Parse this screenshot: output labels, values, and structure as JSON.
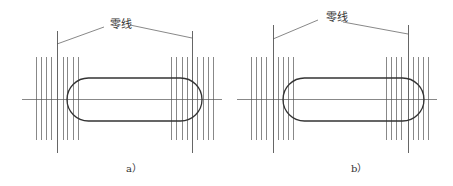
{
  "panels": [
    {
      "id": "a",
      "caption": "a）",
      "zero_line_label": "零线",
      "label_pos": [
        110,
        23
      ],
      "caption_pos": [
        126,
        160
      ],
      "centerline": {
        "x1": 22,
        "x2": 222,
        "y": 99
      },
      "slot": {
        "x1": 67,
        "x2": 202,
        "y1": 78,
        "y2": 121
      },
      "hatch": {
        "y1": 57,
        "y2": 140,
        "left": [
          36,
          41,
          46,
          51,
          63,
          67,
          73,
          78
        ],
        "right": [
          171,
          176,
          182,
          187,
          197,
          203,
          208,
          213
        ]
      },
      "zero_lines": {
        "y1": 31,
        "y2": 153,
        "x": [
          57,
          192
        ]
      },
      "leaders": [
        [
          57,
          44,
          104,
          27
        ],
        [
          130,
          25,
          192,
          38
        ]
      ]
    },
    {
      "id": "b",
      "caption": "b）",
      "zero_line_label": "零线",
      "label_pos": [
        326,
        16
      ],
      "caption_pos": [
        351,
        160
      ],
      "centerline": {
        "x1": 237,
        "x2": 437,
        "y": 99
      },
      "slot": {
        "x1": 283,
        "x2": 424,
        "y1": 78,
        "y2": 121
      },
      "hatch": {
        "y1": 57,
        "y2": 140,
        "left": [
          251,
          256,
          261,
          266,
          278,
          283,
          288,
          293
        ],
        "right": [
          386,
          391,
          396,
          401,
          413,
          418,
          423,
          428
        ]
      },
      "zero_lines": {
        "y1": 25,
        "y2": 153,
        "x": [
          273,
          408
        ]
      },
      "leaders": [
        [
          273,
          39,
          318,
          20
        ],
        [
          343,
          22,
          408,
          34
        ]
      ]
    }
  ],
  "colors": {
    "line": "#555555",
    "slot": "#333333",
    "bg": "#ffffff"
  }
}
